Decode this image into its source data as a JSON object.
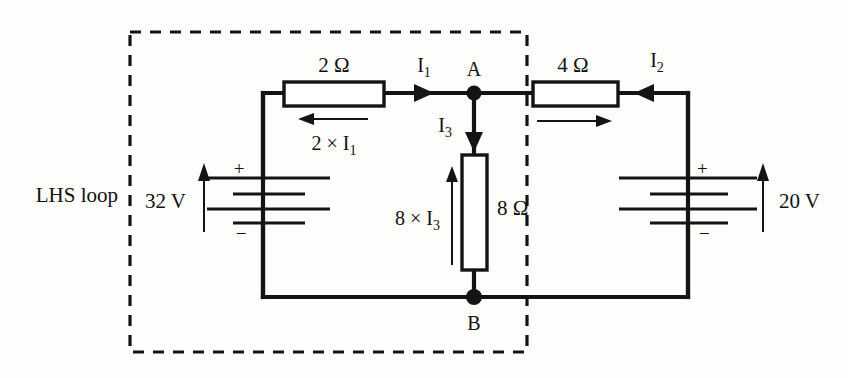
{
  "diagram": {
    "outside_label": "LHS loop",
    "colors": {
      "ink": "#141414",
      "background": "#fdfdfb",
      "resistor_fill": "#ffffff"
    },
    "components": {
      "resistor_top_left": {
        "value_label": "2 Ω",
        "drop_label": "2 × I",
        "drop_label_sub": "1",
        "orientation": "horizontal"
      },
      "resistor_top_right": {
        "value_label": "4 Ω",
        "orientation": "horizontal"
      },
      "resistor_middle": {
        "value_label": "8 Ω",
        "drop_label": "8 × I",
        "drop_label_sub": "3",
        "orientation": "vertical"
      },
      "battery_left": {
        "value_label": "32 V",
        "plus_sign": "+",
        "minus_sign": "−"
      },
      "battery_right": {
        "value_label": "20 V",
        "plus_sign": "+",
        "minus_sign": "−"
      }
    },
    "nodes": [
      {
        "name": "A",
        "label": "A"
      },
      {
        "name": "B",
        "label": "B"
      }
    ],
    "currents": [
      {
        "name": "I1",
        "label": "I",
        "sub": "1",
        "direction": "right"
      },
      {
        "name": "I2",
        "label": "I",
        "sub": "2",
        "direction": "left"
      },
      {
        "name": "I3",
        "label": "I",
        "sub": "3",
        "direction": "down"
      }
    ]
  }
}
